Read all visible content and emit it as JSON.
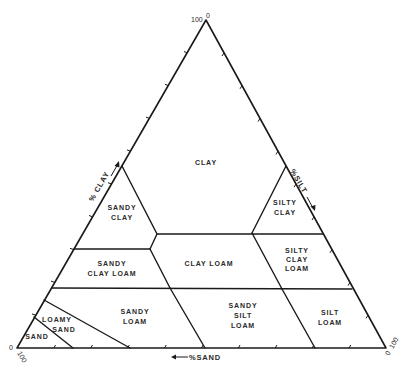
{
  "diagram": {
    "type": "soil-texture-triangle",
    "vertices": {
      "top": {
        "label_a": "100",
        "label_b": "0"
      },
      "bottom_left": {
        "label_a": "0",
        "label_b": "100"
      },
      "bottom_right": {
        "label_a": "0",
        "label_b": "100"
      }
    },
    "axes": {
      "clay": {
        "label": "% CLAY",
        "direction": "up-left edge"
      },
      "silt": {
        "label": "%SILT",
        "direction": "down-right edge"
      },
      "sand": {
        "label": "%SAND",
        "direction": "leftward along base"
      }
    },
    "regions": [
      {
        "id": "clay",
        "lines": [
          "CLAY"
        ]
      },
      {
        "id": "sandy-clay",
        "lines": [
          "SANDY",
          "CLAY"
        ]
      },
      {
        "id": "silty-clay",
        "lines": [
          "SILTY",
          "CLAY"
        ]
      },
      {
        "id": "sandy-clay-loam",
        "lines": [
          "SANDY",
          "CLAY LOAM"
        ]
      },
      {
        "id": "clay-loam",
        "lines": [
          "CLAY LOAM"
        ]
      },
      {
        "id": "silty-clay-loam",
        "lines": [
          "SILTY",
          "CLAY",
          "LOAM"
        ]
      },
      {
        "id": "sandy-loam",
        "lines": [
          "SANDY",
          "LOAM"
        ]
      },
      {
        "id": "sandy-silt-loam",
        "lines": [
          "SANDY",
          "SILT",
          "LOAM"
        ]
      },
      {
        "id": "silt-loam",
        "lines": [
          "SILT",
          "LOAM"
        ]
      },
      {
        "id": "loamy-sand",
        "lines": [
          "LOAMY",
          "SAND"
        ]
      },
      {
        "id": "sand",
        "lines": [
          "SAND"
        ]
      }
    ],
    "colors": {
      "line": "#1a1a1a",
      "text": "#2a2a2a",
      "background": "#ffffff"
    }
  }
}
